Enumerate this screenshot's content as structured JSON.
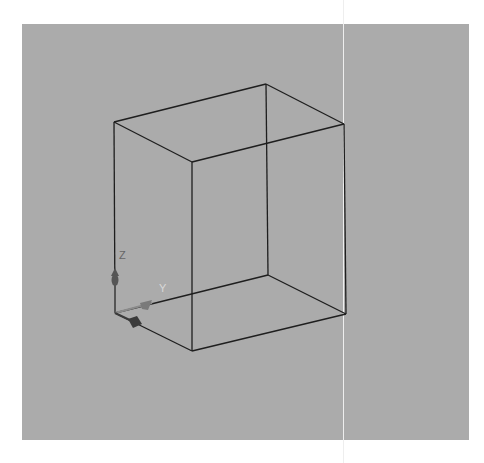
{
  "viewport": {
    "background": "#ababab",
    "edge_color": "#1e1e1e"
  },
  "cube": {
    "vertices": {
      "top_left": [
        114,
        122
      ],
      "top_back": [
        266,
        84
      ],
      "top_right": [
        344,
        124
      ],
      "top_front": [
        192,
        162
      ],
      "bottom_left": [
        115,
        313
      ],
      "bottom_back": [
        268,
        275
      ],
      "bottom_right": [
        346,
        314
      ],
      "bottom_front": [
        192,
        351
      ]
    }
  },
  "axes": {
    "z_label": "Z",
    "y_label": "Y",
    "x_label": "",
    "z_color": "#555555",
    "y_color": "#7a7a7a",
    "x_color": "#3a3a3a"
  }
}
